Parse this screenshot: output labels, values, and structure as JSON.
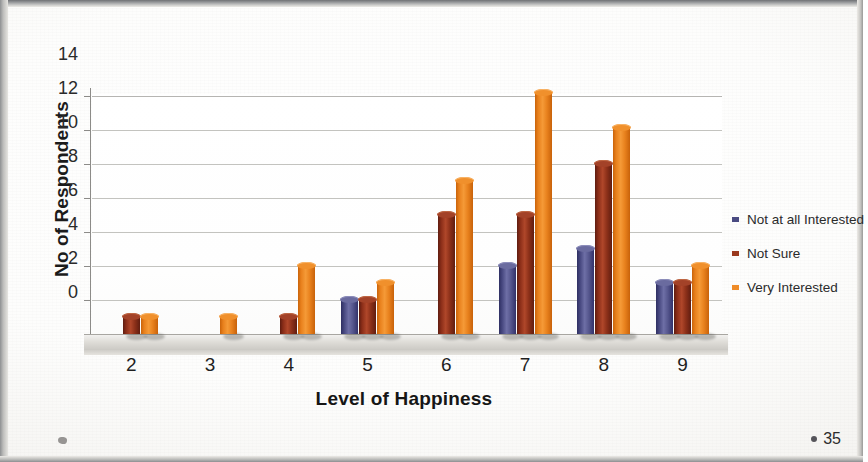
{
  "page": {
    "page_number": "35",
    "corner_mark_icon": "diamond-mark-icon"
  },
  "legend": {
    "items": [
      {
        "label": "Not at all Interested",
        "color": "#4a4b82"
      },
      {
        "label": "Not Sure",
        "color": "#9b3a1f"
      },
      {
        "label": "Very Interested",
        "color": "#ef8c28"
      }
    ]
  },
  "chart_data": {
    "type": "bar",
    "title": "",
    "xlabel": "Level of Happiness",
    "ylabel": "No of Respondents",
    "categories": [
      "2",
      "3",
      "4",
      "5",
      "6",
      "7",
      "8",
      "9"
    ],
    "ylim": [
      0,
      14
    ],
    "yticks": [
      0,
      2,
      4,
      6,
      8,
      10,
      12,
      14
    ],
    "grid": true,
    "legend_position": "right",
    "series": [
      {
        "name": "Not at all Interested",
        "color": "#4a4b82",
        "values": [
          0,
          0,
          0,
          2,
          0,
          4,
          5,
          3
        ]
      },
      {
        "name": "Not Sure",
        "color": "#9b3a1f",
        "values": [
          1,
          0,
          1,
          2,
          7,
          7,
          10,
          3
        ]
      },
      {
        "name": "Very Interested",
        "color": "#ef8c28",
        "values": [
          1,
          1,
          4,
          3,
          9,
          14.2,
          12.1,
          4
        ]
      }
    ]
  }
}
